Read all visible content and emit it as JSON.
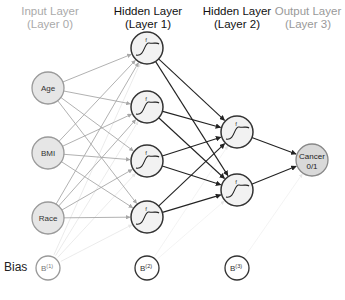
{
  "layers": [
    {
      "title": "Input Layer",
      "subtitle": "(Layer 0)"
    },
    {
      "title": "Hidden Layer",
      "subtitle": "(Layer 1)"
    },
    {
      "title": "Hidden Layer",
      "subtitle": "(Layer 2)"
    },
    {
      "title": "Output Layer",
      "subtitle": "(Layer 3)"
    }
  ],
  "inputs": [
    "Age",
    "BMI",
    "Race"
  ],
  "hidden1_count": 4,
  "hidden2_count": 2,
  "activation_symbol": "f",
  "output": {
    "line1": "Cancer",
    "line2": "0/1"
  },
  "bias_label": "Bias",
  "biases": [
    {
      "base": "B",
      "sup": "(1)"
    },
    {
      "base": "B",
      "sup": "(2)"
    },
    {
      "base": "B",
      "sup": "(3)"
    }
  ],
  "colors": {
    "input_fill": "#e6e6e6",
    "input_stroke": "#9a9a9a",
    "input_edge": "#a8a8a8",
    "bias1_edge": "#e6e6e6",
    "hidden_edge": "#222222",
    "bias_edge": "#f0f0f0",
    "node_fill": "#f2f2f2"
  }
}
